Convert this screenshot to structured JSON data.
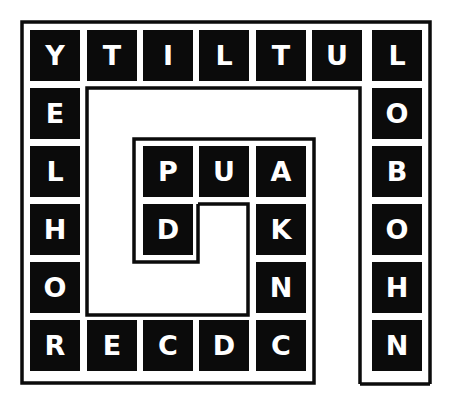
{
  "puzzle": {
    "type": "spiral-word-puzzle",
    "colors": {
      "cell_bg": "#0b0b0b",
      "cell_text": "#ffffff",
      "frame": "#0b0b0b",
      "background": "#ffffff"
    },
    "grid": {
      "columns": 7,
      "rows": 6,
      "cells": [
        {
          "row": 0,
          "col": 0,
          "letter": "Y"
        },
        {
          "row": 0,
          "col": 1,
          "letter": "T"
        },
        {
          "row": 0,
          "col": 2,
          "letter": "I"
        },
        {
          "row": 0,
          "col": 3,
          "letter": "L"
        },
        {
          "row": 0,
          "col": 4,
          "letter": "T"
        },
        {
          "row": 0,
          "col": 5,
          "letter": "U"
        },
        {
          "row": 0,
          "col": 6,
          "letter": "L"
        },
        {
          "row": 1,
          "col": 0,
          "letter": "E"
        },
        {
          "row": 1,
          "col": 6,
          "letter": "O"
        },
        {
          "row": 2,
          "col": 0,
          "letter": "L"
        },
        {
          "row": 2,
          "col": 2,
          "letter": "P"
        },
        {
          "row": 2,
          "col": 3,
          "letter": "U"
        },
        {
          "row": 2,
          "col": 4,
          "letter": "A"
        },
        {
          "row": 2,
          "col": 6,
          "letter": "B"
        },
        {
          "row": 3,
          "col": 0,
          "letter": "H"
        },
        {
          "row": 3,
          "col": 2,
          "letter": "D"
        },
        {
          "row": 3,
          "col": 4,
          "letter": "K"
        },
        {
          "row": 3,
          "col": 6,
          "letter": "O"
        },
        {
          "row": 4,
          "col": 0,
          "letter": "O"
        },
        {
          "row": 4,
          "col": 4,
          "letter": "N"
        },
        {
          "row": 4,
          "col": 6,
          "letter": "H"
        },
        {
          "row": 5,
          "col": 0,
          "letter": "R"
        },
        {
          "row": 5,
          "col": 1,
          "letter": "E"
        },
        {
          "row": 5,
          "col": 2,
          "letter": "C"
        },
        {
          "row": 5,
          "col": 3,
          "letter": "D"
        },
        {
          "row": 5,
          "col": 4,
          "letter": "C"
        },
        {
          "row": 5,
          "col": 6,
          "letter": "N"
        }
      ]
    }
  }
}
